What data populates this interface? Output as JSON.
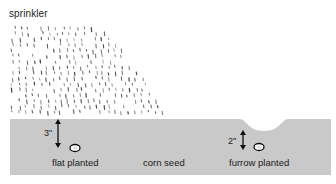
{
  "diagram": {
    "title": "sprinkler",
    "labels": {
      "flat": "flat planted",
      "seed": "corn seed",
      "furrow": "furrow planted"
    },
    "depths": {
      "flat": "3\"",
      "furrow": "2\""
    },
    "colors": {
      "soil": "#c9c9c9",
      "ink": "#1a1a1a",
      "drops": "#444444",
      "background": "#ffffff"
    },
    "icons": [
      "sprinkler-spray",
      "seed-icon",
      "depth-arrow-icon"
    ]
  }
}
